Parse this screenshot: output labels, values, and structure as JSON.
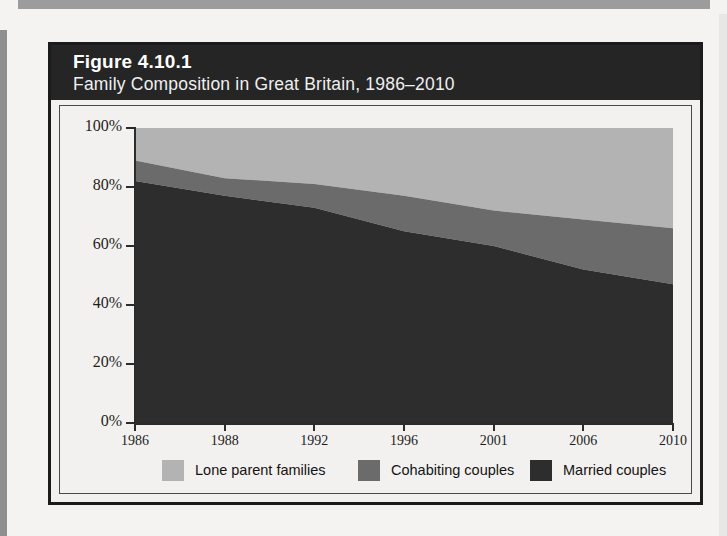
{
  "page": {
    "background_color": "#f4f3f1",
    "edge_band_color": "#9c9c9c"
  },
  "figure": {
    "number_label": "Figure 4.10.1",
    "title": "Family Composition in Great Britain, 1986–2010",
    "header_bg": "#252525",
    "header_text_color": "#ffffff",
    "border_color": "#1b1b1b"
  },
  "chart_data": {
    "type": "area",
    "stacked": true,
    "title": "Family Composition in Great Britain, 1986–2010",
    "subtitle": "Figure 4.10.1",
    "xlabel": "",
    "ylabel": "",
    "categories": [
      "1986",
      "1988",
      "1992",
      "1996",
      "2001",
      "2006",
      "2010"
    ],
    "x_tick_labels": [
      "1986",
      "1988",
      "1992",
      "1996",
      "2001",
      "2006",
      "2010"
    ],
    "y_tick_labels": [
      "0%",
      "20%",
      "40%",
      "60%",
      "80%",
      "100%"
    ],
    "y_tick_values": [
      0,
      20,
      40,
      60,
      80,
      100
    ],
    "ylim": [
      0,
      100
    ],
    "grid": false,
    "legend_position": "bottom",
    "series": [
      {
        "name": "Married couples",
        "color": "#2d2d2d",
        "values": [
          82,
          77,
          73,
          65,
          60,
          52,
          47
        ]
      },
      {
        "name": "Cohabiting couples",
        "color": "#6b6b6b",
        "values": [
          7,
          6,
          8,
          12,
          12,
          17,
          19
        ]
      },
      {
        "name": "Lone parent families",
        "color": "#b3b3b3",
        "values": [
          11,
          17,
          19,
          23,
          28,
          31,
          34
        ]
      }
    ],
    "cumulative_tops": {
      "married": [
        82,
        77,
        73,
        65,
        60,
        52,
        47
      ],
      "married_plus_cohabiting": [
        89,
        83,
        81,
        77,
        72,
        69,
        66
      ],
      "total": [
        100,
        100,
        100,
        100,
        100,
        100,
        100
      ]
    },
    "legend": [
      {
        "label": "Lone parent families",
        "color": "#b3b3b3"
      },
      {
        "label": "Cohabiting couples",
        "color": "#6b6b6b"
      },
      {
        "label": "Married couples",
        "color": "#2d2d2d"
      }
    ]
  }
}
